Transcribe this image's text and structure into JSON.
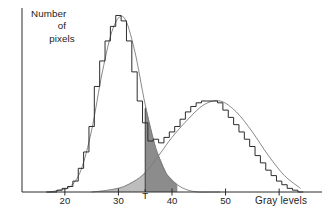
{
  "figure": {
    "title_visible": false,
    "background": "#ffffff",
    "ink_color": "#2b2b2b",
    "light_shade_color": "#bdbdbd",
    "dark_shade_color": "#8c8c8c",
    "curve_color": "#7a7a7a"
  },
  "axes": {
    "y_axis_label_lines": [
      "Number",
      "of",
      "pixels"
    ],
    "x_axis_title": "Gray  levels",
    "x_tick_labels": [
      "20",
      "30",
      "T",
      "40",
      "50"
    ],
    "x_tick_values": [
      20,
      30,
      35,
      40,
      50
    ],
    "threshold_label": "T",
    "threshold_value": 35
  },
  "chart_data": {
    "type": "line",
    "title": "",
    "xlabel": "Gray  levels",
    "ylabel": "Number of pixels",
    "xlim": [
      12,
      68
    ],
    "ylim": [
      0,
      100
    ],
    "grid": false,
    "legend": "none",
    "x_ticks": [
      20,
      30,
      40,
      50
    ],
    "x_tick_labels": [
      "20",
      "30",
      "40",
      "50"
    ],
    "y_ticks": [],
    "annotations": [
      {
        "text": "T",
        "x": 35,
        "y": 0,
        "note": "threshold marker on x-axis"
      },
      {
        "text": "Number of pixels",
        "x": 14,
        "y": 95,
        "note": "y-axis label"
      },
      {
        "text": "Gray  levels",
        "x": 61,
        "y": 0,
        "note": "x-axis title"
      }
    ],
    "series": [
      {
        "name": "histogram",
        "style": "step",
        "x": [
          17,
          18,
          19,
          20,
          21,
          22,
          23,
          24,
          25,
          26,
          27,
          28,
          29,
          30,
          31,
          32,
          33,
          34,
          35,
          36,
          37,
          38,
          39,
          40,
          41,
          42,
          43,
          44,
          45,
          46,
          47,
          48,
          49,
          50,
          51,
          52,
          53,
          54,
          55,
          56,
          57,
          58,
          59,
          60,
          61,
          62,
          63,
          64
        ],
        "values": [
          0,
          0,
          1,
          2,
          3,
          6,
          13,
          22,
          36,
          58,
          72,
          83,
          91,
          97,
          94,
          83,
          66,
          50,
          38,
          28,
          29,
          27,
          30,
          33,
          36,
          40,
          44,
          47,
          49,
          50,
          50,
          50,
          49,
          45,
          41,
          37,
          33,
          29,
          25,
          20,
          16,
          12,
          9,
          6,
          4,
          2,
          1,
          0
        ]
      },
      {
        "name": "object-mode-gaussian",
        "style": "smooth",
        "x": [
          17,
          19,
          21,
          23,
          25,
          27,
          29,
          31,
          33,
          35,
          37,
          39,
          41,
          43,
          45,
          47,
          49
        ],
        "values": [
          0,
          1,
          3,
          12,
          34,
          66,
          90,
          96,
          78,
          48,
          24,
          10,
          4,
          1,
          0,
          0,
          0
        ]
      },
      {
        "name": "background-mode-gaussian",
        "style": "smooth",
        "x": [
          25,
          28,
          31,
          34,
          36,
          38,
          40,
          43,
          46,
          49,
          52,
          55,
          58,
          61,
          64
        ],
        "values": [
          0,
          1,
          3,
          8,
          14,
          22,
          30,
          40,
          48,
          50,
          44,
          33,
          20,
          9,
          2
        ]
      }
    ],
    "shaded_regions": [
      {
        "name": "background-error-below-threshold",
        "fill": "#bdbdbd",
        "x_from": 17,
        "x_to": 35,
        "description": "background distribution tail left of threshold T"
      },
      {
        "name": "object-error-above-threshold",
        "fill": "#8c8c8c",
        "x_from": 35,
        "x_to": 41,
        "description": "object distribution tail right of threshold T"
      }
    ]
  }
}
